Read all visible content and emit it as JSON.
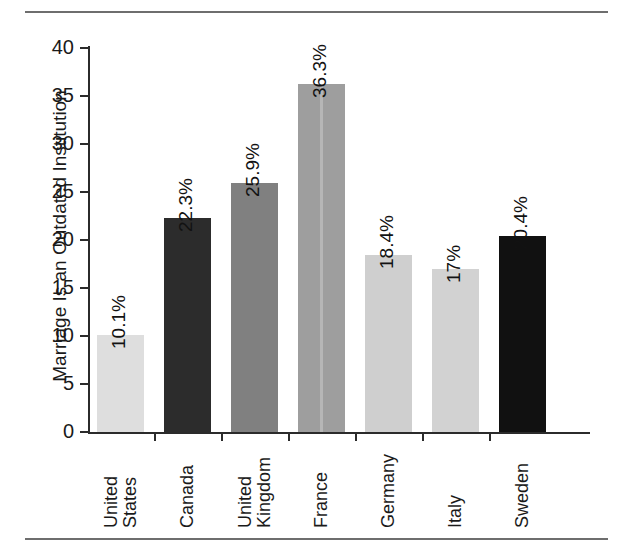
{
  "figure": {
    "y_axis_title": "Marriage Is an Outdated Institution",
    "y_ticks": [
      "0",
      "5",
      "10",
      "15",
      "20",
      "25",
      "30",
      "35",
      "40"
    ]
  },
  "chart_data": {
    "type": "bar",
    "title": "",
    "xlabel": "",
    "ylabel": "Marriage Is an Outdated Institution",
    "ylim": [
      0,
      40
    ],
    "ytick_values": [
      0,
      5,
      10,
      15,
      20,
      25,
      30,
      35,
      40
    ],
    "grid": false,
    "legend": "none",
    "categories": [
      "United States",
      "Canada",
      "United Kingdom",
      "France",
      "Germany",
      "Italy",
      "Sweden"
    ],
    "category_lines": [
      [
        "United",
        "States"
      ],
      [
        "Canada"
      ],
      [
        "United",
        "Kingdom"
      ],
      [
        "France"
      ],
      [
        "Germany"
      ],
      [
        "Italy"
      ],
      [
        "Sweden"
      ]
    ],
    "values": [
      10.1,
      22.3,
      25.9,
      36.3,
      18.4,
      17.0,
      20.4
    ],
    "data_labels": [
      "10.1%",
      "22.3%",
      "25.9%",
      "36.3%",
      "18.4%",
      "17%",
      "20.4%"
    ],
    "bar_colors": [
      "#dedede",
      "#2c2c2c",
      "#808080",
      "#9e9e9e",
      "#cfcfcf",
      "#d2d2d2",
      "#111111"
    ]
  },
  "bars": [
    {
      "label": "United States",
      "lines": [
        "United",
        "States"
      ],
      "value": 10.1,
      "data_label": "10.1%",
      "color": "#dedede"
    },
    {
      "label": "Canada",
      "lines": [
        "Canada"
      ],
      "value": 22.3,
      "data_label": "22.3%",
      "color": "#2c2c2c"
    },
    {
      "label": "United Kingdom",
      "lines": [
        "United",
        "Kingdom"
      ],
      "value": 25.9,
      "data_label": "25.9%",
      "color": "#808080"
    },
    {
      "label": "France",
      "lines": [
        "France"
      ],
      "value": 36.3,
      "data_label": "36.3%",
      "color": "#9e9e9e"
    },
    {
      "label": "Germany",
      "lines": [
        "Germany"
      ],
      "value": 18.4,
      "data_label": "18.4%",
      "color": "#cfcfcf"
    },
    {
      "label": "Italy",
      "lines": [
        "Italy"
      ],
      "value": 17.0,
      "data_label": "17%",
      "color": "#d2d2d2"
    },
    {
      "label": "Sweden",
      "lines": [
        "Sweden"
      ],
      "value": 20.4,
      "data_label": "20.4%",
      "color": "#111111"
    }
  ]
}
